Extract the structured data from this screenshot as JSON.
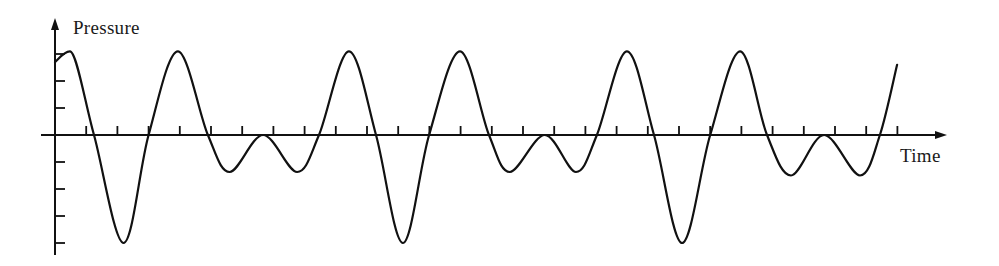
{
  "chart_data": {
    "type": "line",
    "title": "",
    "xlabel": "Time",
    "ylabel": "Pressure",
    "grid": false,
    "legend": null,
    "x_ticks_count": 27,
    "y_ticks": [
      -4,
      -3,
      -2,
      -1,
      1,
      2,
      3
    ],
    "xlim": [
      0,
      28.5
    ],
    "ylim": [
      -4.5,
      4.3
    ],
    "tick_labels_shown": false,
    "colors": {
      "line": "#111111",
      "axis": "#111111",
      "background": "#ffffff"
    },
    "series": [
      {
        "name": "Pressure waveform",
        "x": [
          0,
          0.48,
          1.25,
          2.2,
          3.0,
          3.94,
          4.9,
          5.6,
          6.67,
          7.76,
          8.46,
          9.42,
          10.29,
          11.15,
          11.99,
          12.98,
          13.91,
          14.58,
          15.7,
          16.7,
          17.37,
          18.33,
          19.2,
          20.1,
          21.0,
          21.96,
          22.82,
          23.59,
          24.65,
          25.8,
          26.44,
          26.99
        ],
        "y": [
          2.7,
          3.1,
          0,
          -4.0,
          0,
          3.1,
          0,
          -1.37,
          0,
          -1.37,
          0,
          3.1,
          0,
          -4.0,
          0,
          3.1,
          0,
          -1.37,
          0,
          -1.37,
          0,
          3.1,
          0,
          -4.0,
          0,
          3.1,
          0,
          -1.5,
          0,
          -1.5,
          0,
          2.6
        ]
      }
    ]
  },
  "layout": {
    "origin_px": [
      55,
      135
    ],
    "x_unit_px": 31.2,
    "y_unit_px": 27,
    "x_axis_end_px": 947,
    "y_axis_top_px": 18,
    "y_axis_bottom_px": 255
  }
}
